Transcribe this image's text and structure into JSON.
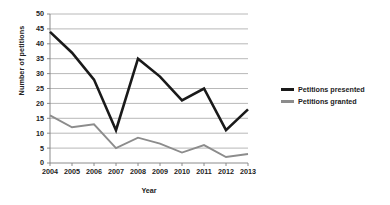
{
  "chart_data": {
    "type": "line",
    "title": "",
    "xlabel": "Year",
    "ylabel": "Number of petitions",
    "categories": [
      "2004",
      "2005",
      "2006",
      "2007",
      "2008",
      "2009",
      "2010",
      "2011",
      "2012",
      "2013"
    ],
    "x": [
      2004,
      2005,
      2006,
      2007,
      2008,
      2009,
      2010,
      2011,
      2012,
      2013
    ],
    "series": [
      {
        "name": "Petitions presented",
        "color": "#1a1a1a",
        "values": [
          44,
          37,
          28,
          11,
          35,
          29,
          21,
          25,
          11,
          18
        ]
      },
      {
        "name": "Petitions granted",
        "color": "#8c8c8c",
        "values": [
          16,
          12,
          13,
          5,
          8.5,
          6.5,
          3.5,
          6,
          2,
          3
        ]
      }
    ],
    "ylim": [
      0,
      50
    ],
    "yticks": [
      0,
      5,
      10,
      15,
      20,
      25,
      30,
      35,
      40,
      45,
      50
    ],
    "ytick_labels": [
      "0",
      "5",
      "10",
      "15",
      "20",
      "25",
      "30",
      "35",
      "40",
      "45",
      "50"
    ],
    "grid": "horizontal",
    "gridline_color": "#a6a6a6",
    "axis_color": "#808080",
    "legend_position": "right",
    "background": "#ffffff"
  }
}
